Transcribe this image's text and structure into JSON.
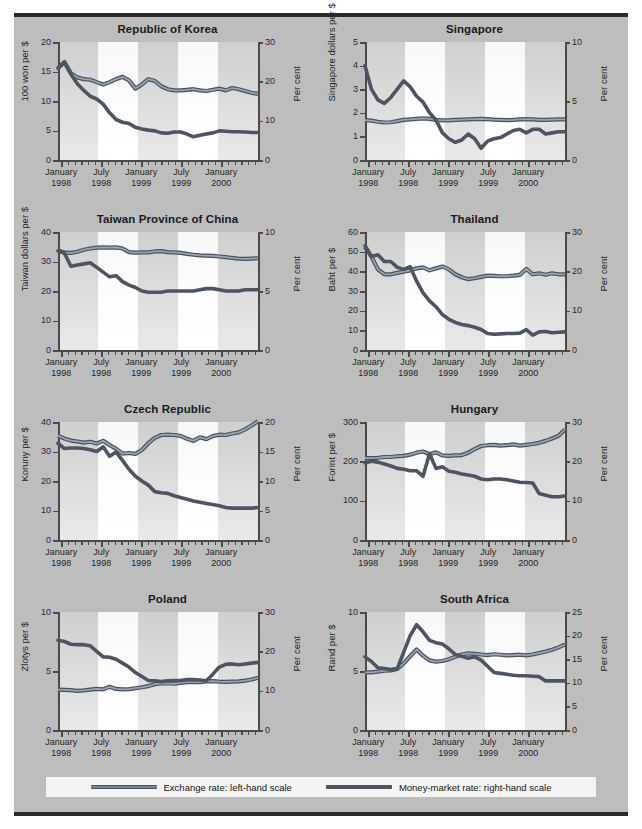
{
  "figure": {
    "background_color": "#bdbdbd",
    "border_color": "#2b2b2b"
  },
  "legend": {
    "position": "bottom",
    "items": [
      {
        "label": "Exchange rate: left-hand scale",
        "color": "#7b8796",
        "style": "double-line"
      },
      {
        "label": "Money-market rate: right-hand scale",
        "color": "#4e5560",
        "style": "thick-line"
      }
    ]
  },
  "x_axis": {
    "tick_labels": [
      {
        "line1": "January",
        "line2": "1998"
      },
      {
        "line1": "July",
        "line2": "1998"
      },
      {
        "line1": "January",
        "line2": "1999"
      },
      {
        "line1": "July",
        "line2": "1999"
      },
      {
        "line1": "January",
        "line2": "2000"
      }
    ],
    "minor_ticks": "monthly",
    "range_months": 30,
    "start": "January 1998",
    "end": "June 2000"
  },
  "chart_data": [
    {
      "type": "line",
      "title": "Republic of Korea",
      "xlabel": "",
      "ylabel": "100 won per $",
      "ylabel_right": "Per cent",
      "ylim": [
        0,
        20
      ],
      "yticks": [
        0,
        5,
        10,
        15,
        20
      ],
      "ylim_right": [
        0,
        30
      ],
      "yticks_right": [
        0,
        10,
        20,
        30
      ],
      "grid": false,
      "series": [
        {
          "name": "Exchange rate: left-hand scale",
          "axis": "left",
          "color": "#7b8796",
          "values": [
            15.6,
            16.6,
            14.7,
            14.0,
            13.7,
            13.6,
            13.2,
            12.8,
            13.2,
            13.7,
            14.1,
            13.5,
            12.1,
            12.8,
            13.7,
            13.4,
            12.5,
            12.0,
            11.8,
            11.8,
            11.9,
            12.0,
            11.8,
            11.7,
            11.9,
            12.1,
            11.8,
            12.2,
            12.0,
            11.7,
            11.4,
            11.2
          ]
        },
        {
          "name": "Money-market rate: right-hand scale",
          "axis": "right",
          "color": "#4e5560",
          "values": [
            23.3,
            24.8,
            21.8,
            19.4,
            17.7,
            16.2,
            15.5,
            14.2,
            12.0,
            10.3,
            9.6,
            9.3,
            8.3,
            7.9,
            7.6,
            7.4,
            6.9,
            6.8,
            7.1,
            7.1,
            6.6,
            5.9,
            6.3,
            6.6,
            6.9,
            7.4,
            7.3,
            7.2,
            7.2,
            7.1,
            7.0,
            7.0
          ]
        }
      ]
    },
    {
      "type": "line",
      "title": "Singapore",
      "xlabel": "",
      "ylabel": "Singapore dollars per $",
      "ylabel_right": "Per cent",
      "ylim": [
        0,
        5
      ],
      "yticks": [
        0,
        1,
        2,
        3,
        4,
        5
      ],
      "ylim_right": [
        0,
        10
      ],
      "yticks_right": [
        0,
        5,
        10
      ],
      "grid": false,
      "series": [
        {
          "name": "Exchange rate: left-hand scale",
          "axis": "left",
          "color": "#7b8796",
          "values": [
            1.69,
            1.67,
            1.62,
            1.59,
            1.6,
            1.65,
            1.7,
            1.72,
            1.74,
            1.76,
            1.74,
            1.7,
            1.68,
            1.68,
            1.7,
            1.71,
            1.72,
            1.73,
            1.74,
            1.73,
            1.71,
            1.7,
            1.69,
            1.7,
            1.72,
            1.73,
            1.72,
            1.7,
            1.7,
            1.71,
            1.72,
            1.72
          ]
        },
        {
          "name": "Money-market rate: right-hand scale",
          "axis": "right",
          "color": "#4e5560",
          "values": [
            8.0,
            6.0,
            5.1,
            4.8,
            5.3,
            6.0,
            6.7,
            6.2,
            5.4,
            4.9,
            4.0,
            3.4,
            2.3,
            1.8,
            1.5,
            1.7,
            2.2,
            1.8,
            1.0,
            1.6,
            1.8,
            1.9,
            2.2,
            2.5,
            2.6,
            2.3,
            2.6,
            2.6,
            2.2,
            2.3,
            2.4,
            2.4
          ]
        }
      ]
    },
    {
      "type": "line",
      "title": "Taiwan Province of China",
      "xlabel": "",
      "ylabel": "Taiwan dollars per $",
      "ylabel_right": "Per cent",
      "ylim": [
        0,
        40
      ],
      "yticks": [
        0,
        10,
        20,
        30,
        40
      ],
      "ylim_right": [
        0,
        10
      ],
      "yticks_right": [
        0,
        5,
        10
      ],
      "grid": false,
      "series": [
        {
          "name": "Exchange rate: left-hand scale",
          "axis": "left",
          "color": "#7b8796",
          "values": [
            33.8,
            33.0,
            32.9,
            33.3,
            34.0,
            34.4,
            34.7,
            34.8,
            34.7,
            34.8,
            34.4,
            33.2,
            33.0,
            33.1,
            33.1,
            33.4,
            33.5,
            33.2,
            33.1,
            32.9,
            32.6,
            32.3,
            32.1,
            32.0,
            31.9,
            31.7,
            31.5,
            31.2,
            31.0,
            30.9,
            31.0,
            31.1
          ]
        },
        {
          "name": "Money-market rate: right-hand scale",
          "axis": "right",
          "color": "#4e5560",
          "values": [
            8.4,
            8.2,
            7.1,
            7.2,
            7.3,
            7.4,
            7.0,
            6.6,
            6.2,
            6.3,
            5.8,
            5.5,
            5.3,
            5.0,
            4.9,
            4.9,
            4.9,
            5.0,
            5.0,
            5.0,
            5.0,
            5.0,
            5.1,
            5.2,
            5.2,
            5.1,
            5.0,
            5.0,
            5.0,
            5.1,
            5.1,
            5.1
          ]
        }
      ]
    },
    {
      "type": "line",
      "title": "Thailand",
      "xlabel": "",
      "ylabel": "Baht per $",
      "ylabel_right": "Per cent",
      "ylim": [
        0,
        60
      ],
      "yticks": [
        0,
        10,
        20,
        30,
        40,
        50,
        60
      ],
      "ylim_right": [
        0,
        30
      ],
      "yticks_right": [
        0,
        10,
        20,
        30
      ],
      "grid": false,
      "series": [
        {
          "name": "Exchange rate: left-hand scale",
          "axis": "left",
          "color": "#7b8796",
          "values": [
            52.5,
            47.5,
            41.0,
            38.5,
            38.5,
            39.2,
            39.8,
            40.5,
            41.5,
            42.0,
            40.5,
            41.5,
            42.5,
            41.0,
            38.5,
            37.0,
            36.0,
            36.5,
            37.2,
            37.8,
            37.7,
            37.5,
            37.5,
            37.8,
            38.2,
            41.2,
            38.5,
            39.0,
            38.3,
            39.0,
            38.5,
            38.5
          ]
        },
        {
          "name": "Money-market rate: right-hand scale",
          "axis": "right",
          "color": "#4e5560",
          "values": [
            26.5,
            23.8,
            24.2,
            22.5,
            22.5,
            21.0,
            20.5,
            21.2,
            17.5,
            14.5,
            12.5,
            11.0,
            9.0,
            7.8,
            7.0,
            6.5,
            6.2,
            5.8,
            5.2,
            4.2,
            4.0,
            4.1,
            4.2,
            4.2,
            4.3,
            5.2,
            3.8,
            4.6,
            4.7,
            4.4,
            4.5,
            4.6
          ]
        }
      ]
    },
    {
      "type": "line",
      "title": "Czech Republic",
      "xlabel": "",
      "ylabel": "Koruny per $",
      "ylabel_right": "Per cent",
      "ylim": [
        0,
        40
      ],
      "yticks": [
        0,
        10,
        20,
        30,
        40
      ],
      "ylim_right": [
        0,
        20
      ],
      "yticks_right": [
        0,
        5,
        10,
        15,
        20
      ],
      "grid": false,
      "series": [
        {
          "name": "Exchange rate: left-hand scale",
          "axis": "left",
          "color": "#7b8796",
          "values": [
            35.3,
            34.4,
            33.7,
            33.4,
            33.0,
            33.3,
            32.7,
            33.6,
            32.2,
            30.9,
            29.3,
            29.5,
            29.2,
            30.5,
            32.8,
            34.6,
            35.6,
            35.7,
            35.6,
            35.3,
            34.3,
            33.6,
            34.8,
            34.2,
            35.2,
            35.7,
            35.6,
            36.1,
            36.5,
            37.5,
            38.8,
            40.3
          ]
        },
        {
          "name": "Money-market rate: right-hand scale",
          "axis": "right",
          "color": "#4e5560",
          "values": [
            16.4,
            15.5,
            15.6,
            15.6,
            15.5,
            15.3,
            15.0,
            15.8,
            14.2,
            14.9,
            13.5,
            12.0,
            10.8,
            10.0,
            9.3,
            8.2,
            8.0,
            7.9,
            7.5,
            7.2,
            6.9,
            6.6,
            6.4,
            6.2,
            6.0,
            5.8,
            5.5,
            5.4,
            5.4,
            5.4,
            5.4,
            5.5
          ]
        }
      ]
    },
    {
      "type": "line",
      "title": "Hungary",
      "xlabel": "",
      "ylabel": "Forint per $",
      "ylabel_right": "Per cent",
      "ylim": [
        0,
        300
      ],
      "yticks": [
        0,
        100,
        200,
        300
      ],
      "ylim_right": [
        0,
        30
      ],
      "yticks_right": [
        0,
        10,
        20,
        30
      ],
      "grid": false,
      "series": [
        {
          "name": "Exchange rate: left-hand scale",
          "axis": "left",
          "color": "#7b8796",
          "values": [
            208,
            208,
            209,
            211,
            211,
            213,
            214,
            217,
            222,
            225,
            218,
            223,
            215,
            214,
            215,
            216,
            222,
            231,
            239,
            241,
            242,
            240,
            241,
            243,
            240,
            242,
            244,
            247,
            252,
            258,
            265,
            281
          ]
        },
        {
          "name": "Money-market rate: right-hand scale",
          "axis": "right",
          "color": "#4e5560",
          "values": [
            19.6,
            20.0,
            19.8,
            19.3,
            18.8,
            18.2,
            18.0,
            17.6,
            17.6,
            16.2,
            22.0,
            18.2,
            18.6,
            17.5,
            17.2,
            16.8,
            16.5,
            16.2,
            15.5,
            15.3,
            15.5,
            15.5,
            15.3,
            15.0,
            14.7,
            14.6,
            14.5,
            11.8,
            11.4,
            11.0,
            11.0,
            11.2
          ]
        }
      ]
    },
    {
      "type": "line",
      "title": "Poland",
      "xlabel": "",
      "ylabel": "Zlotys per $",
      "ylabel_right": "Per cent",
      "ylim": [
        0,
        10
      ],
      "yticks": [
        0,
        5,
        10
      ],
      "ylim_right": [
        0,
        30
      ],
      "yticks_right": [
        0,
        10,
        20,
        30
      ],
      "grid": false,
      "series": [
        {
          "name": "Exchange rate: left-hand scale",
          "axis": "left",
          "color": "#7b8796",
          "values": [
            3.42,
            3.4,
            3.38,
            3.32,
            3.36,
            3.42,
            3.48,
            3.44,
            3.66,
            3.48,
            3.44,
            3.46,
            3.54,
            3.62,
            3.72,
            3.88,
            3.94,
            3.96,
            3.92,
            4.0,
            4.06,
            4.06,
            4.06,
            4.12,
            4.14,
            4.1,
            4.08,
            4.1,
            4.12,
            4.18,
            4.28,
            4.42
          ]
        },
        {
          "name": "Money-market rate: right-hand scale",
          "axis": "right",
          "color": "#4e5560",
          "values": [
            22.8,
            22.5,
            21.8,
            21.7,
            21.7,
            21.4,
            20.0,
            18.6,
            18.5,
            18.0,
            17.0,
            16.0,
            14.6,
            13.6,
            12.6,
            12.5,
            12.3,
            12.5,
            12.6,
            12.6,
            12.8,
            12.8,
            12.7,
            12.5,
            14.2,
            16.0,
            16.7,
            16.8,
            16.6,
            16.8,
            17.0,
            17.2
          ]
        }
      ]
    },
    {
      "type": "line",
      "title": "South Africa",
      "xlabel": "",
      "ylabel": "Rand per $",
      "ylabel_right": "Per cent",
      "ylim": [
        0,
        10
      ],
      "yticks": [
        0,
        5,
        10
      ],
      "ylim_right": [
        0,
        25
      ],
      "yticks_right": [
        0,
        5,
        10,
        15,
        20,
        25
      ],
      "grid": false,
      "series": [
        {
          "name": "Exchange rate: left-hand scale",
          "axis": "left",
          "color": "#7b8796",
          "values": [
            4.88,
            4.88,
            4.95,
            5.02,
            5.05,
            5.18,
            5.65,
            6.25,
            6.82,
            6.3,
            5.9,
            5.8,
            5.85,
            6.0,
            6.2,
            6.4,
            6.5,
            6.45,
            6.4,
            6.35,
            6.42,
            6.38,
            6.32,
            6.35,
            6.38,
            6.32,
            6.4,
            6.52,
            6.65,
            6.8,
            7.0,
            7.25
          ]
        },
        {
          "name": "Money-market rate: right-hand scale",
          "axis": "right",
          "color": "#4e5560",
          "values": [
            15.5,
            14.5,
            13.2,
            13.0,
            12.8,
            13.0,
            16.5,
            20.0,
            22.3,
            20.8,
            19.0,
            18.5,
            18.2,
            17.2,
            16.0,
            15.6,
            15.2,
            15.5,
            14.8,
            13.5,
            12.2,
            12.0,
            11.8,
            11.6,
            11.5,
            11.5,
            11.4,
            11.3,
            10.4,
            10.4,
            10.4,
            10.4
          ]
        }
      ]
    }
  ]
}
